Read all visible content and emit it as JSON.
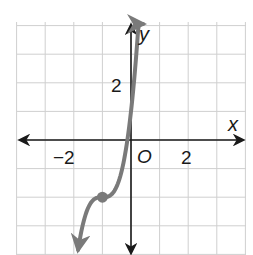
{
  "chart_data": {
    "type": "line",
    "title": "",
    "xlabel": "x",
    "ylabel": "y",
    "xlim": [
      -4,
      4
    ],
    "ylim": [
      -4,
      4
    ],
    "grid": true,
    "grid_step": 1,
    "x_tick_labels": [
      {
        "value": -2,
        "label": "−2"
      },
      {
        "value": 2,
        "label": "2"
      }
    ],
    "y_tick_labels": [
      {
        "value": 2,
        "label": "2"
      }
    ],
    "origin_label": "O",
    "series": [
      {
        "name": "cubic curve",
        "color": "#7a7a7a",
        "x": [
          -1.85,
          -1.6,
          -1.4,
          -1.2,
          -1.0,
          -0.8,
          -0.6,
          -0.4,
          -0.2,
          0.0,
          0.2,
          0.35,
          0.45
        ],
        "y": [
          -3.84,
          -2.65,
          -2.19,
          -2.02,
          -2.0,
          -1.98,
          -1.81,
          -1.35,
          -0.46,
          1.0,
          3.18,
          5.6,
          7.5
        ]
      }
    ],
    "highlighted_points": [
      {
        "x": -1,
        "y": -2,
        "label": "inflection point"
      }
    ],
    "colors": {
      "axis": "#1a1a1a",
      "grid": "#cfcfcf",
      "curve": "#7a7a7a"
    }
  },
  "labels": {
    "x_axis": "x",
    "y_axis": "y",
    "origin": "O",
    "x_neg2": "−2",
    "x_pos2": "2",
    "y_pos2": "2"
  }
}
